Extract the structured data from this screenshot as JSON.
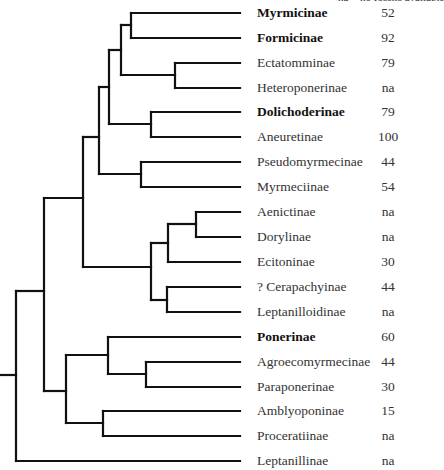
{
  "header_note": "na = no fossils available",
  "tree": {
    "tip_x_end": 240,
    "root_stub": {
      "x1": 0,
      "x2": 16,
      "y": 375
    },
    "tips": [
      {
        "name": "Myrmicinae",
        "value": "52",
        "bold": true,
        "y": 13,
        "x_start": 131
      },
      {
        "name": "Formicinae",
        "value": "92",
        "bold": true,
        "y": 38,
        "x_start": 131
      },
      {
        "name": "Ectatomminae",
        "value": "79",
        "bold": false,
        "y": 63,
        "x_start": 175
      },
      {
        "name": "Heteroponerinae",
        "value": "na",
        "bold": false,
        "y": 88,
        "x_start": 175
      },
      {
        "name": "Dolichoderinae",
        "value": "79",
        "bold": true,
        "y": 112,
        "x_start": 151
      },
      {
        "name": "Aneuretinae",
        "value": "100",
        "bold": false,
        "y": 137,
        "x_start": 151
      },
      {
        "name": "Pseudomyrmecinae",
        "value": "44",
        "bold": false,
        "y": 162,
        "x_start": 141
      },
      {
        "name": "Myrmeciinae",
        "value": "54",
        "bold": false,
        "y": 187,
        "x_start": 141
      },
      {
        "name": "Aenictinae",
        "value": "na",
        "bold": false,
        "y": 212,
        "x_start": 196
      },
      {
        "name": "Dorylinae",
        "value": "na",
        "bold": false,
        "y": 237,
        "x_start": 196
      },
      {
        "name": "Ecitoninae",
        "value": "30",
        "bold": false,
        "y": 262,
        "x_start": 168
      },
      {
        "name": "? Cerapachyinae",
        "value": "44",
        "bold": false,
        "y": 287,
        "x_start": 167
      },
      {
        "name": "Leptanilloidinae",
        "value": "na",
        "bold": false,
        "y": 312,
        "x_start": 167
      },
      {
        "name": "Ponerinae",
        "value": "60",
        "bold": true,
        "y": 337,
        "x_start": 108
      },
      {
        "name": "Agroecomyrmecinae",
        "value": "44",
        "bold": false,
        "y": 362,
        "x_start": 146
      },
      {
        "name": "Paraponerinae",
        "value": "30",
        "bold": false,
        "y": 387,
        "x_start": 146
      },
      {
        "name": "Amblyoponinae",
        "value": "15",
        "bold": false,
        "y": 411,
        "x_start": 103
      },
      {
        "name": "Proceratiinae",
        "value": "na",
        "bold": false,
        "y": 436,
        "x_start": 103
      },
      {
        "name": "Leptanillinae",
        "value": "na",
        "bold": false,
        "y": 461,
        "x_start": 16
      }
    ],
    "nodes": [
      {
        "id": "myr-form",
        "x": 131,
        "y1": 13,
        "y2": 38,
        "parent_x": 121,
        "stem_y": 25
      },
      {
        "id": "ect-het",
        "x": 175,
        "y1": 63,
        "y2": 88,
        "parent_x": 121,
        "stem_y": 75
      },
      {
        "id": "formicoid-a",
        "x": 121,
        "y1": 25,
        "y2": 75,
        "parent_x": 109,
        "stem_y": 50
      },
      {
        "id": "dol-ane",
        "x": 151,
        "y1": 112,
        "y2": 137,
        "parent_x": 109,
        "stem_y": 124
      },
      {
        "id": "formicoid-b",
        "x": 109,
        "y1": 50,
        "y2": 124,
        "parent_x": 99,
        "stem_y": 87
      },
      {
        "id": "pse-myr",
        "x": 141,
        "y1": 162,
        "y2": 187,
        "parent_x": 99,
        "stem_y": 174
      },
      {
        "id": "formicoid-c",
        "x": 99,
        "y1": 87,
        "y2": 174,
        "parent_x": 83,
        "stem_y": 137
      },
      {
        "id": "aen-dor",
        "x": 196,
        "y1": 212,
        "y2": 237,
        "parent_x": 168,
        "stem_y": 224
      },
      {
        "id": "dorylomorph-a",
        "x": 168,
        "y1": 224,
        "y2": 262,
        "parent_x": 151,
        "stem_y": 243
      },
      {
        "id": "cer-lep",
        "x": 167,
        "y1": 287,
        "y2": 312,
        "parent_x": 151,
        "stem_y": 300
      },
      {
        "id": "dorylomorph",
        "x": 151,
        "y1": 243,
        "y2": 300,
        "parent_x": 83,
        "stem_y": 267
      },
      {
        "id": "formicoid",
        "x": 83,
        "y1": 137,
        "y2": 267,
        "parent_x": 44,
        "stem_y": 198
      },
      {
        "id": "agr-par",
        "x": 146,
        "y1": 362,
        "y2": 387,
        "parent_x": 108,
        "stem_y": 374
      },
      {
        "id": "poneroid-a",
        "x": 108,
        "y1": 337,
        "y2": 374,
        "parent_x": 66,
        "stem_y": 355
      },
      {
        "id": "amb-pro",
        "x": 103,
        "y1": 411,
        "y2": 436,
        "parent_x": 66,
        "stem_y": 423
      },
      {
        "id": "poneroid",
        "x": 66,
        "y1": 355,
        "y2": 423,
        "parent_x": 44,
        "stem_y": 391
      },
      {
        "id": "main-clade",
        "x": 44,
        "y1": 198,
        "y2": 391,
        "parent_x": 16,
        "stem_y": 291
      },
      {
        "id": "root",
        "x": 16,
        "y1": 291,
        "y2": 461,
        "parent_x": 0,
        "stem_y": 375
      }
    ]
  }
}
